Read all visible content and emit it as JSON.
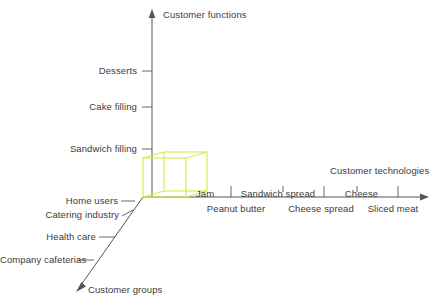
{
  "diagram": {
    "background_color": "#ffffff",
    "line_color": "#555555",
    "text_color": "#3b3b3b",
    "cube_color": "#d8e84f"
  },
  "axes": {
    "vertical": {
      "name": "customer-functions-axis",
      "title": "Customer functions",
      "ticks": [
        {
          "label": "Desserts"
        },
        {
          "label": "Cake filling"
        },
        {
          "label": "Sandwich filling"
        }
      ]
    },
    "horizontal": {
      "name": "customer-technologies-axis",
      "title": "Customer technologies",
      "ticks_upper": [
        {
          "label": "Jam"
        },
        {
          "label": "Sandwich spread"
        },
        {
          "label": "Cheese"
        }
      ],
      "ticks_lower": [
        {
          "label": "Peanut butter"
        },
        {
          "label": "Cheese spread"
        },
        {
          "label": "Sliced meat"
        }
      ]
    },
    "depth": {
      "name": "customer-groups-axis",
      "title": "Customer groups",
      "ticks": [
        {
          "label": "Home users"
        },
        {
          "label": "Catering industry"
        },
        {
          "label": "Health care"
        },
        {
          "label": "Company cafeterias"
        }
      ]
    }
  }
}
